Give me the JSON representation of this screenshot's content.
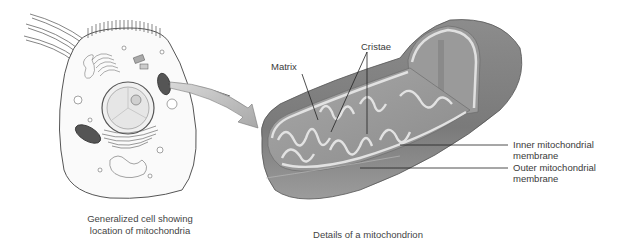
{
  "diagram": {
    "left_panel": {
      "caption_line1": "Generalized cell showing",
      "caption_line2": "location of mitochondria"
    },
    "right_panel": {
      "caption": "Details of a mitochondrion",
      "labels": {
        "matrix": "Matrix",
        "cristae": "Cristae",
        "inner_line1": "Inner mitochondrial",
        "inner_line2": "membrane",
        "outer_line1": "Outer mitochondrial",
        "outer_line2": "membrane"
      }
    },
    "colors": {
      "line": "#222222",
      "outer_membrane": "#7a7a7a",
      "matrix_fill": "#9a9a9a",
      "cristae_fill": "#d8d8d8",
      "arrow_fill": "#bdbdbd"
    }
  }
}
